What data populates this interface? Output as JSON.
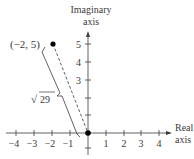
{
  "figure": {
    "type": "complex-plane-diagram",
    "axes": {
      "x_label_line1": "Real",
      "x_label_line2": "axis",
      "y_label_line1": "Imaginary",
      "y_label_line2": "axis",
      "x_ticks": [
        "−4",
        "−3",
        "−2",
        "−1",
        "1",
        "2",
        "3",
        "4"
      ],
      "y_ticks": [
        "1",
        "2",
        "3",
        "4",
        "5"
      ],
      "y_tick_labels_shown": [
        "3",
        "4",
        "5"
      ]
    },
    "points": [
      {
        "label": "(−2, 5)",
        "x": -2,
        "y": 5
      },
      {
        "label": "",
        "x": 0,
        "y": 0
      }
    ],
    "distance_label": "29",
    "distance_prefix": "√",
    "colors": {
      "ink": "#3a3a3a",
      "point": "#000000",
      "background": "#ffffff"
    }
  }
}
